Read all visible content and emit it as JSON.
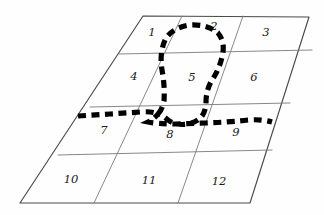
{
  "figure": {
    "background_color": "#fefefe",
    "grid_line_color": "#7a7a7a",
    "border_line_color": "#4a4a4a",
    "dashed_curve_color": "#000000"
  },
  "grid": {
    "rows": 4,
    "columns": 3,
    "cells": [
      {
        "label": "1",
        "cx": 152,
        "cy": 33
      },
      {
        "label": "2",
        "cx": 214,
        "cy": 27
      },
      {
        "label": "3",
        "cx": 266,
        "cy": 33
      },
      {
        "label": "4",
        "cx": 134,
        "cy": 77
      },
      {
        "label": "5",
        "cx": 192,
        "cy": 78
      },
      {
        "label": "6",
        "cx": 254,
        "cy": 78
      },
      {
        "label": "7",
        "cx": 104,
        "cy": 131
      },
      {
        "label": "8",
        "cx": 170,
        "cy": 135
      },
      {
        "label": "9",
        "cx": 236,
        "cy": 133
      },
      {
        "label": "10",
        "cx": 71,
        "cy": 180
      },
      {
        "label": "11",
        "cx": 149,
        "cy": 181
      },
      {
        "label": "12",
        "cx": 219,
        "cy": 182
      }
    ]
  },
  "outline": {
    "name": "parallelogram-border",
    "corners": {
      "top_left": {
        "x": 143,
        "y": 16
      },
      "top_right": {
        "x": 309,
        "y": 17
      },
      "bottom_right": {
        "x": 250,
        "y": 203
      },
      "bottom_left": {
        "x": 20,
        "y": 203
      }
    }
  },
  "grid_lines": {
    "horizontal": [
      {
        "name": "row-divider-1",
        "x1": 119,
        "y1": 54,
        "x2": 312,
        "y2": 50
      },
      {
        "name": "row-divider-2",
        "x1": 90,
        "y1": 107,
        "x2": 290,
        "y2": 103
      },
      {
        "name": "row-divider-3",
        "x1": 58,
        "y1": 155,
        "x2": 272,
        "y2": 150
      }
    ],
    "vertical": [
      {
        "name": "col-divider-1",
        "x1": 182,
        "y1": 16,
        "x2": 94,
        "y2": 203
      },
      {
        "name": "col-divider-2",
        "x1": 243,
        "y1": 16,
        "x2": 178,
        "y2": 203
      }
    ]
  },
  "dashed_curve": {
    "name": "region-boundary-curve",
    "description": "Dashed loop enclosing cell 5 and extending horizontally across the row-3 divider",
    "stroke_width": 5.2,
    "dash_pattern": "8 5.5",
    "path": "M 78 116 L 110 114 L 140 112 Q 152 111 158 114 Q 162 110 164 101 Q 165 86 162 70 Q 159 52 166 38 Q 174 27 190 25 Q 208 24 218 33 Q 226 43 222 57 Q 219 70 212 80 Q 206 90 206 102 Q 206 110 202 116 Q 197 122 188 124 Q 176 126 168 120 Q 161 114 158 114 Q 154 119 148 122 Q 158 124 176 124 L 206 123 Q 232 122 248 120 Q 262 119 272 122"
  }
}
